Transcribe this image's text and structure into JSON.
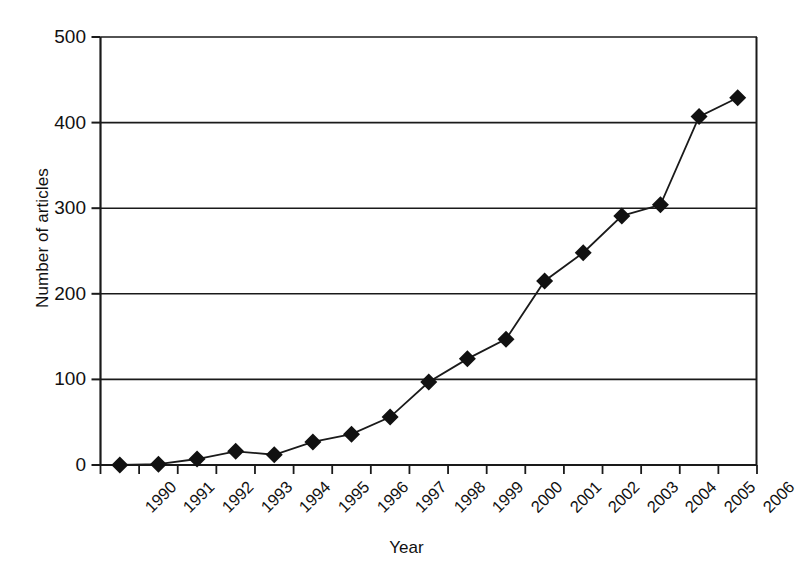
{
  "chart_data": {
    "type": "line",
    "title": "",
    "xlabel": "Year",
    "ylabel": "Number of articles",
    "categories": [
      "1990",
      "1991",
      "1992",
      "1993",
      "1994",
      "1995",
      "1996",
      "1997",
      "1998",
      "1999",
      "2000",
      "2001",
      "2002",
      "2003",
      "2004",
      "2005",
      "2006"
    ],
    "values": [
      0,
      1,
      7,
      16,
      12,
      27,
      36,
      56,
      97,
      124,
      147,
      215,
      248,
      291,
      304,
      407,
      429
    ],
    "series": [
      {
        "name": "Number of articles",
        "values": [
          0,
          1,
          7,
          16,
          12,
          27,
          36,
          56,
          97,
          124,
          147,
          215,
          248,
          291,
          304,
          407,
          429
        ]
      }
    ],
    "ylim": [
      0,
      500
    ],
    "y_ticks": [
      0,
      100,
      200,
      300,
      400,
      500
    ],
    "y_tick_labels": [
      "0",
      "100",
      "200",
      "300",
      "400",
      "500"
    ],
    "grid": "horizontal",
    "legend": "none",
    "marker": "filled-diamond",
    "line_color": "#1a1a1a",
    "marker_color": "#111111",
    "axis_color": "#1a1a1a",
    "background_color": "#ffffff",
    "x_tick_label_rotation": -45
  },
  "axes": {
    "y_title": "Number of articles",
    "x_title": "Year"
  }
}
